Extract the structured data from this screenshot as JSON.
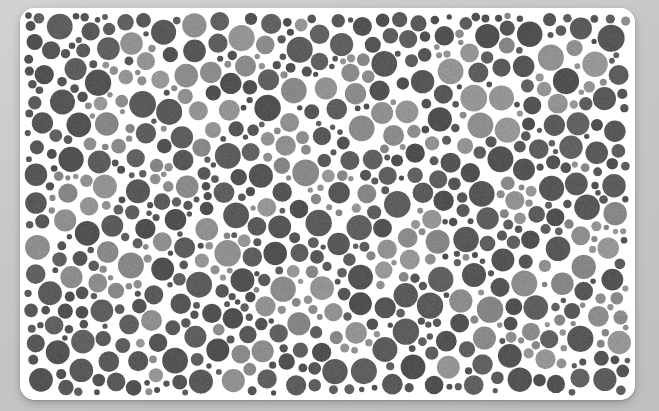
{
  "scene": {
    "name": "ishihara-color-vision-test-plate",
    "description": "Grayscale pseudoisochromatic dot plate (Ishihara-style color blindness test card) photographed on a plain light-gray surface.",
    "background_color": "#c9c9c9",
    "background_gradient_from": "#d2d2d2",
    "background_gradient_to": "#bfbfbf"
  },
  "card": {
    "name": "plate-card",
    "fill": "#ffffff",
    "x": 20,
    "y": 8,
    "width": 615,
    "height": 392,
    "corner_radius": 15,
    "shadow_color": "rgba(0,0,0,0.22)"
  },
  "plate": {
    "shape": "rectangle",
    "dot_field_inset": 4,
    "background_dot_color": "#585858",
    "figure_dot_color": "#8e8e8e",
    "gap_color": "#ffffff",
    "min_dot_radius": 2.6,
    "max_dot_radius": 13.5,
    "approx_dot_count": 1150,
    "noise_amplitude": 10,
    "tone_labels": {
      "dark": "background-tone-dots",
      "light": "figure-tone-dots"
    },
    "random_seed": 20240517
  },
  "chart_data": {
    "type": "scatter",
    "title": "",
    "xlabel": "",
    "ylabel": "",
    "xlim": [
      0,
      615
    ],
    "ylim": [
      0,
      392
    ],
    "grid": false,
    "legend_position": "none",
    "series": [
      {
        "name": "background-tone-dots",
        "color": "#585858",
        "share": 0.79
      },
      {
        "name": "figure-tone-dots",
        "color": "#8e8e8e",
        "share": 0.21
      }
    ],
    "figure_blob_centers": [
      [
        118,
        60
      ],
      [
        230,
        48
      ],
      [
        330,
        72
      ],
      [
        432,
        44
      ],
      [
        545,
        66
      ],
      [
        84,
        118
      ],
      [
        182,
        96
      ],
      [
        268,
        140
      ],
      [
        372,
        118
      ],
      [
        470,
        100
      ],
      [
        560,
        150
      ],
      [
        60,
        190
      ],
      [
        150,
        172
      ],
      [
        240,
        206
      ],
      [
        318,
        186
      ],
      [
        402,
        228
      ],
      [
        500,
        196
      ],
      [
        578,
        232
      ],
      [
        96,
        262
      ],
      [
        196,
        246
      ],
      [
        286,
        288
      ],
      [
        368,
        262
      ],
      [
        456,
        300
      ],
      [
        540,
        270
      ],
      [
        130,
        330
      ],
      [
        232,
        352
      ],
      [
        330,
        320
      ],
      [
        430,
        356
      ],
      [
        520,
        334
      ],
      [
        592,
        306
      ]
    ],
    "figure_blob_radius": 26
  },
  "accessibility": {
    "alt_text": "Ishihara-style color vision test plate rendered in grayscale: hundreds of overlapping circles of two gray tones fill a white rounded card."
  }
}
